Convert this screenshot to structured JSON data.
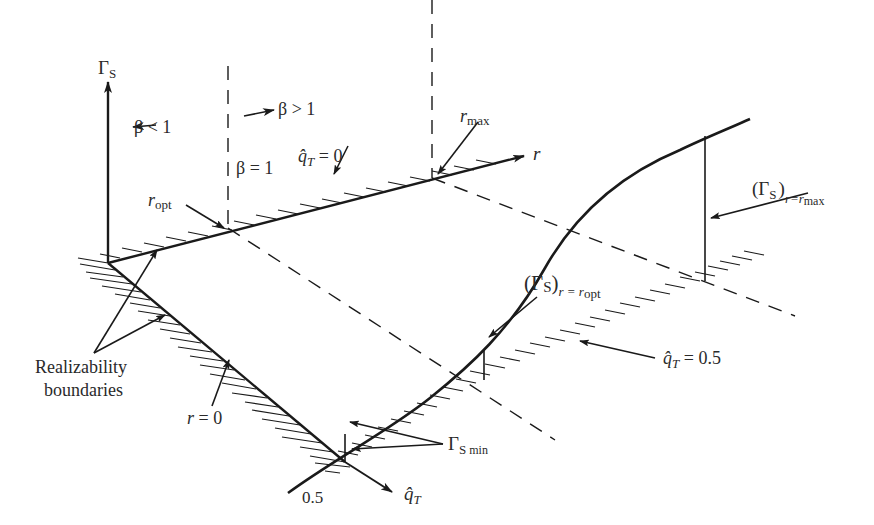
{
  "figure": {
    "type": "3d-surface-schematic",
    "colors": {
      "ink": "#1a1a1a",
      "background": "#ffffff"
    },
    "axes": {
      "vertical": {
        "label": "Γ",
        "subscript": "S"
      },
      "r_axis": {
        "label": "r"
      },
      "q_axis": {
        "label": "q̂",
        "subscript": "T"
      }
    },
    "labels": {
      "beta_less": "β < 1",
      "beta_greater": "β > 1",
      "beta_equal": "β = 1",
      "r_max": {
        "main": "r",
        "sub": "max"
      },
      "r_opt": {
        "main": "r",
        "sub": "opt"
      },
      "qT_zero": {
        "main": "q̂",
        "sub": "T",
        "rest": " = 0"
      },
      "qT_half": {
        "main": "q̂",
        "sub": "T",
        "rest": " = 0.5"
      },
      "gamma_rmax": {
        "open": "(Γ",
        "s": "S",
        "close": ")",
        "sub": "r=r",
        "subsub": "max"
      },
      "gamma_ropt": {
        "open": "(Γ",
        "s": "S",
        "close": ")",
        "sub": "r = r",
        "subsub": "opt"
      },
      "gamma_min": {
        "main": "Γ",
        "sub": "S",
        "subsub": "min"
      },
      "realizability_line1": "Realizability",
      "realizability_line2": "boundaries",
      "r_zero": {
        "main": "r",
        "rest": " = 0"
      },
      "half_tick": "0.5"
    }
  }
}
